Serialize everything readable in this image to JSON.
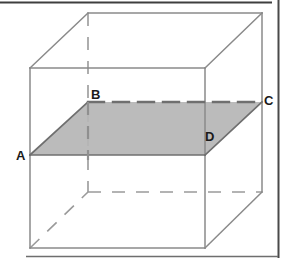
{
  "figure": {
    "type": "geometry-diagram",
    "canvas": {
      "width": 291,
      "height": 261,
      "background": "#ffffff"
    },
    "colors": {
      "solid_edge": "#8a8a8a",
      "hidden_edge": "#9a9a9a",
      "shade_fill": "#b5b5b5",
      "shade_edge": "#6f6f6f",
      "label_text": "#1a1a1a",
      "scan_border": "#4a4a4a"
    },
    "labels": [
      {
        "id": "label-a",
        "text": "A",
        "x": 16,
        "y": 149
      },
      {
        "id": "label-b",
        "text": "B",
        "x": 91,
        "y": 88
      },
      {
        "id": "label-c",
        "text": "C",
        "x": 264,
        "y": 94
      },
      {
        "id": "label-d",
        "text": "D",
        "x": 205,
        "y": 130
      }
    ],
    "cube": {
      "front_face": {
        "name": "front-face",
        "points": "30,68 205,68 205,248 30,248"
      },
      "top_back_edge": {
        "name": "top-back-edge",
        "x1": 88,
        "y1": 13,
        "x2": 262,
        "y2": 13
      },
      "top_left_diagonal": {
        "name": "top-left-diagonal-edge",
        "x1": 30,
        "y1": 68,
        "x2": 88,
        "y2": 13
      },
      "top_right_diagonal": {
        "name": "top-right-diagonal-edge",
        "x1": 205,
        "y1": 68,
        "x2": 262,
        "y2": 13
      },
      "right_back_vertical": {
        "name": "right-back-vertical-edge",
        "x1": 262,
        "y1": 13,
        "x2": 262,
        "y2": 192
      },
      "bottom_right_diagonal": {
        "name": "bottom-right-diagonal-edge",
        "x1": 205,
        "y1": 248,
        "x2": 262,
        "y2": 192
      },
      "hidden_back_vertical": {
        "name": "hidden-back-vertical-edge",
        "x1": 88,
        "y1": 13,
        "x2": 88,
        "y2": 192
      },
      "hidden_bottom_back": {
        "name": "hidden-bottom-back-edge",
        "x1": 88,
        "y1": 192,
        "x2": 262,
        "y2": 192
      },
      "hidden_bottom_left_diagonal": {
        "name": "hidden-bottom-left-diagonal-edge",
        "x1": 30,
        "y1": 248,
        "x2": 88,
        "y2": 192
      }
    },
    "section_plane": {
      "name": "shaded-section-abcd",
      "points": "30,155 88,102 262,102 205,155",
      "front_edge_ad": {
        "x1": 30,
        "y1": 155,
        "x2": 205,
        "y2": 155
      },
      "left_edge_ab": {
        "x1": 30,
        "y1": 155,
        "x2": 88,
        "y2": 102
      },
      "right_edge_dc": {
        "x1": 205,
        "y1": 155,
        "x2": 262,
        "y2": 102
      },
      "hidden_edge_bc": {
        "x1": 88,
        "y1": 102,
        "x2": 262,
        "y2": 102
      }
    },
    "scan_artifacts": {
      "top_rule": {
        "name": "scan-top-rule",
        "x1": 0,
        "y1": 2,
        "x2": 272,
        "y2": 2
      },
      "right_rule": {
        "name": "scan-right-rule",
        "x1": 278,
        "y1": 0,
        "x2": 278,
        "y2": 258
      },
      "bottom_rule": {
        "name": "scan-bottom-rule",
        "x1": 26,
        "y1": 256,
        "x2": 278,
        "y2": 256
      }
    }
  }
}
